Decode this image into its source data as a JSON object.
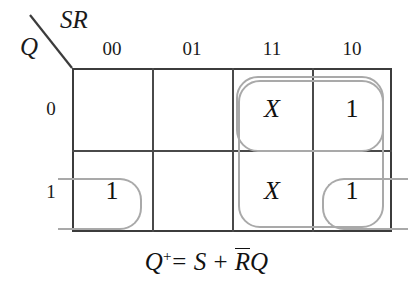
{
  "diagram": {
    "type": "karnaugh-map",
    "corner": {
      "column_variables": "SR",
      "row_variable": "Q"
    },
    "column_headers": [
      "00",
      "01",
      "11",
      "10"
    ],
    "row_headers": [
      "0",
      "1"
    ],
    "cells": [
      {
        "row": "0",
        "col": "00",
        "value": ""
      },
      {
        "row": "0",
        "col": "01",
        "value": ""
      },
      {
        "row": "0",
        "col": "11",
        "value": "X"
      },
      {
        "row": "0",
        "col": "10",
        "value": "1"
      },
      {
        "row": "1",
        "col": "00",
        "value": "1"
      },
      {
        "row": "1",
        "col": "01",
        "value": ""
      },
      {
        "row": "1",
        "col": "11",
        "value": "X"
      },
      {
        "row": "1",
        "col": "10",
        "value": "1"
      }
    ],
    "groups": [
      {
        "name": "s-term-top-row",
        "covers": [
          "0/11",
          "0/10"
        ]
      },
      {
        "name": "s-term-column-11",
        "covers": [
          "0/11",
          "1/11",
          "1/10"
        ]
      },
      {
        "name": "rq-term-wrap-left",
        "covers": [
          "1/00"
        ]
      },
      {
        "name": "rq-term-wrap-right",
        "covers": [
          "1/10"
        ]
      }
    ],
    "equation": {
      "lhs": "Q",
      "lhs_superscript": "+",
      "equals": "=",
      "term1": "S",
      "plus": "+",
      "term2_bar": "R",
      "term2": "Q"
    },
    "colors": {
      "grid_line": "#3c3c3c",
      "group_stroke": "#a9a9a9",
      "text": "#111111",
      "background": "#ffffff"
    }
  }
}
